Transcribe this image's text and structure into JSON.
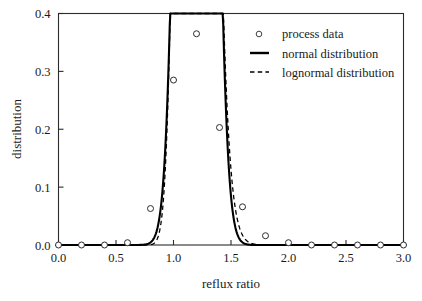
{
  "chart_data": {
    "type": "line",
    "title": "",
    "xlabel": "reflux ratio",
    "ylabel": "distribution",
    "xlim": [
      0.0,
      3.0
    ],
    "ylim": [
      0.0,
      0.4
    ],
    "xticks": [
      "0.0",
      "0.5",
      "1.0",
      "1.5",
      "2.0",
      "2.5",
      "3.0"
    ],
    "xtick_values": [
      0.0,
      0.5,
      1.0,
      1.5,
      2.0,
      2.5,
      3.0
    ],
    "yticks": [
      "0.0",
      "0.1",
      "0.2",
      "0.3",
      "0.4"
    ],
    "ytick_values": [
      0.0,
      0.1,
      0.2,
      0.3,
      0.4
    ],
    "grid": false,
    "legend_position": "top-right",
    "legend": [
      {
        "label": "process data",
        "marker": "open-circle",
        "style": "marker"
      },
      {
        "label": "normal distribution",
        "marker": "solid-line",
        "style": "line"
      },
      {
        "label": "lognormal distribution",
        "marker": "dashed-line",
        "style": "dashed"
      }
    ],
    "series": [
      {
        "name": "process data",
        "style": "open-circle-markers",
        "x": [
          0.0,
          0.2,
          0.4,
          0.6,
          0.8,
          1.0,
          1.2,
          1.4,
          1.6,
          1.8,
          2.0,
          2.2,
          2.4,
          2.6,
          2.8,
          3.0
        ],
        "values": [
          0.0,
          0.0,
          0.0,
          0.004,
          0.063,
          0.285,
          0.365,
          0.203,
          0.066,
          0.016,
          0.004,
          0.0,
          0.0,
          0.0,
          0.0,
          0.0
        ]
      },
      {
        "name": "normal distribution",
        "style": "solid",
        "distribution": "normal",
        "mean": 1.2,
        "sigma": 0.1093,
        "peak": 0.365,
        "x": [
          0.4,
          0.5,
          0.6,
          0.7,
          0.8,
          0.9,
          1.0,
          1.1,
          1.2,
          1.3,
          1.4,
          1.5,
          1.6,
          1.7,
          1.8,
          1.9,
          2.0,
          2.2,
          2.6,
          3.0
        ],
        "values": [
          0.0,
          0.0,
          0.001,
          0.012,
          0.07,
          0.193,
          0.287,
          0.353,
          0.365,
          0.353,
          0.287,
          0.193,
          0.07,
          0.012,
          0.001,
          0.0,
          0.0,
          0.0,
          0.0,
          0.0
        ]
      },
      {
        "name": "lognormal distribution",
        "style": "dashed",
        "distribution": "lognormal",
        "mu": 0.1742,
        "sigma": 0.093,
        "peak": 0.366,
        "x": [
          0.4,
          0.5,
          0.6,
          0.7,
          0.8,
          0.9,
          1.0,
          1.1,
          1.2,
          1.3,
          1.4,
          1.5,
          1.6,
          1.7,
          1.8,
          1.9,
          2.0,
          2.2,
          2.6,
          3.0
        ],
        "values": [
          0.0,
          0.0,
          0.0,
          0.006,
          0.062,
          0.199,
          0.303,
          0.36,
          0.358,
          0.327,
          0.269,
          0.19,
          0.085,
          0.027,
          0.009,
          0.003,
          0.001,
          0.0,
          0.0,
          0.0
        ]
      }
    ]
  },
  "axes": {
    "x_title": "reflux ratio",
    "y_title": "distribution"
  }
}
